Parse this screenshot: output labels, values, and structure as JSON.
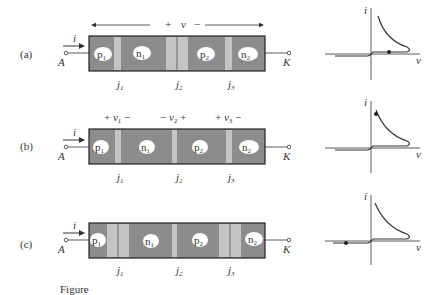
{
  "figure": {
    "caption": "Figure",
    "panels": [
      {
        "id": "a",
        "label": "(a)",
        "current_label": "i",
        "anode": "A",
        "cathode": "K",
        "voltage_span": {
          "plus": "+",
          "v": "v",
          "minus": "−"
        },
        "regions": [
          "p1",
          "n1",
          "p2",
          "n2"
        ],
        "junctions": [
          "j1",
          "j2",
          "j3"
        ],
        "j2_state": "wide depletion (blocking)",
        "graph": {
          "y_axis": "i",
          "x_axis": "v",
          "operating_point": "on low-current forward branch"
        }
      },
      {
        "id": "b",
        "label": "(b)",
        "current_label": "i",
        "anode": "A",
        "cathode": "K",
        "junction_voltages": [
          {
            "text": "+ v1 −"
          },
          {
            "text": "− v2 +"
          },
          {
            "text": "+ v3 −"
          }
        ],
        "regions": [
          "p1",
          "n1",
          "p2",
          "n2"
        ],
        "junctions": [
          "j1",
          "j2",
          "j3"
        ],
        "graph": {
          "y_axis": "i",
          "x_axis": "v",
          "operating_point": "on high-current conducting branch"
        }
      },
      {
        "id": "c",
        "label": "(c)",
        "current_label": "i",
        "anode": "A",
        "cathode": "K",
        "regions": [
          "p1",
          "n1",
          "p2",
          "n2"
        ],
        "junctions": [
          "j1",
          "j2",
          "j3"
        ],
        "graph": {
          "y_axis": "i",
          "x_axis": "v",
          "operating_point": "on reverse-bias branch"
        }
      }
    ],
    "colors": {
      "region_fill": "#8c8c8c",
      "depletion_fill": "#c4c4c4",
      "outline": "#222222",
      "bubble": "#ffffff"
    }
  }
}
